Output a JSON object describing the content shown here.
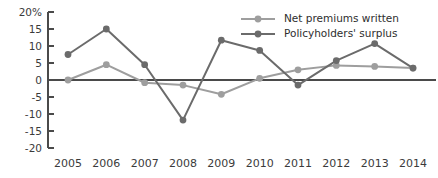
{
  "chart_data": {
    "type": "line",
    "title": "",
    "xlabel": "",
    "ylabel": "",
    "categories": [
      "2005",
      "2006",
      "2007",
      "2008",
      "2009",
      "2010",
      "2011",
      "2012",
      "2013",
      "2014"
    ],
    "ylim": [
      -20,
      20
    ],
    "yticks": [
      "20%",
      "15",
      "10",
      "5",
      "0",
      "-5",
      "-10",
      "-15",
      "-20"
    ],
    "ytick_values": [
      20,
      15,
      10,
      5,
      0,
      -5,
      -10,
      -15,
      -20
    ],
    "grid": false,
    "legend_position": "top-right",
    "series": [
      {
        "name": "Net premiums written",
        "color": "#9e9e9e",
        "values": [
          0,
          4.5,
          -0.8,
          -1.5,
          -4.2,
          0.5,
          3.0,
          4.3,
          4.0,
          3.5
        ]
      },
      {
        "name": "Policyholders' surplus",
        "color": "#6b6b6b",
        "values": [
          7.5,
          15.0,
          4.5,
          -11.8,
          11.7,
          8.7,
          -1.5,
          5.7,
          10.7,
          3.5
        ]
      }
    ]
  },
  "axis": {
    "y_unit_suffix": "%",
    "axis_color": "#4a4a4a"
  }
}
